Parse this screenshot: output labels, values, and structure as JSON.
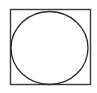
{
  "canvas": {
    "width": 97,
    "height": 93,
    "background_color": "#ffffff",
    "description": "geometric line drawing: circle inscribed in a square"
  },
  "figure": {
    "name": "circle-inscribed-in-square",
    "stroke_color": "#3a3a3a",
    "circle_stroke_color": "#2b2b2b",
    "square": {
      "x": 10.5,
      "y": 9.5,
      "width": 80,
      "height": 75,
      "stroke_width": 1.4
    },
    "circle": {
      "cx": 49.5,
      "cy": 48,
      "rx": 38.5,
      "ry": 36.5,
      "stroke_width": 1.3
    }
  }
}
